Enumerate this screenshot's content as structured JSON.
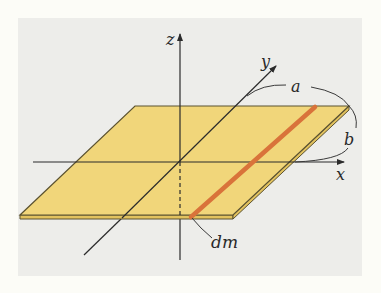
{
  "diagram": {
    "axes": {
      "x_label": "x",
      "y_label": "y",
      "z_label": "z"
    },
    "dimensions": {
      "a_label": "a",
      "b_label": "b"
    },
    "element_label": "dm",
    "colors": {
      "background": "#fcfcf7",
      "panel": "#ededea",
      "plate_fill": "#f1d67a",
      "plate_edge": "#5b5230",
      "strip": "#d9733a",
      "axis": "#2b2b2b"
    }
  }
}
